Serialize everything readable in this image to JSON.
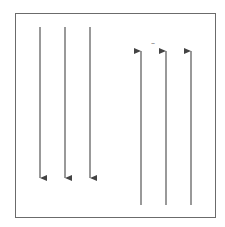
{
  "diagram": {
    "stroke_color": "#555555",
    "frame_color": "#6b6b6b",
    "background": "#ffffff",
    "left_group": {
      "direction": "down",
      "arrows": [
        {
          "x": 40,
          "y1": 27,
          "y2": 178
        },
        {
          "x": 65,
          "y1": 27,
          "y2": 178
        },
        {
          "x": 90,
          "y1": 27,
          "y2": 178
        }
      ]
    },
    "right_group": {
      "direction": "up",
      "arrows": [
        {
          "x": 141,
          "y1": 205,
          "y2": 51
        },
        {
          "x": 166,
          "y1": 205,
          "y2": 51
        },
        {
          "x": 191,
          "y1": 205,
          "y2": 51
        }
      ]
    },
    "mark": {
      "label": "–",
      "x": 153,
      "y": 46
    }
  }
}
